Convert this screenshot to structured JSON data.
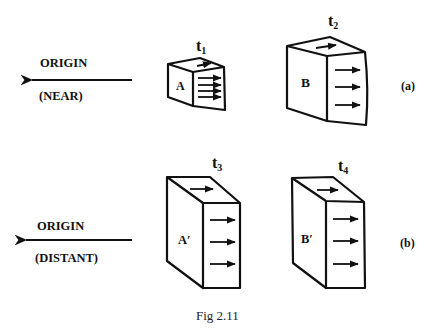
{
  "figure": {
    "caption": "Fig 2.11",
    "colors": {
      "ink": "#111111",
      "background": "#ffffff"
    },
    "panels": [
      {
        "id": "a",
        "label": "(a)",
        "origin": {
          "title": "ORIGIN",
          "qualifier": "(NEAR)"
        },
        "blocks": [
          {
            "time": "t",
            "time_sub": "1",
            "name": "A",
            "face_arrows": 4,
            "top_arrows": 1
          },
          {
            "time": "t",
            "time_sub": "2",
            "name": "B",
            "face_arrows": 3,
            "top_arrows": 1
          }
        ]
      },
      {
        "id": "b",
        "label": "(b)",
        "origin": {
          "title": "ORIGIN",
          "qualifier": "(DISTANT)"
        },
        "blocks": [
          {
            "time": "t",
            "time_sub": "3",
            "name": "A′",
            "face_arrows": 3,
            "top_arrows": 1
          },
          {
            "time": "t",
            "time_sub": "4",
            "name": "B′",
            "face_arrows": 3,
            "top_arrows": 1
          }
        ]
      }
    ]
  }
}
